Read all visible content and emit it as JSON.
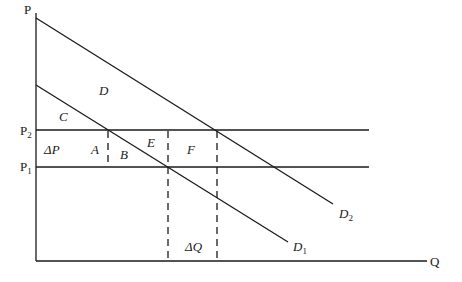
{
  "diagram": {
    "type": "economics-demand-shift",
    "axes": {
      "y_label": "P",
      "x_label": "Q"
    },
    "price_levels": [
      {
        "name": "P2",
        "base": "P",
        "sub": "2"
      },
      {
        "name": "P1",
        "base": "P",
        "sub": "1"
      }
    ],
    "curves": [
      {
        "name": "D2",
        "base": "D",
        "sub": "2"
      },
      {
        "name": "D1",
        "base": "D",
        "sub": "1"
      }
    ],
    "regions": {
      "D": "D",
      "C": "C",
      "A": "A",
      "B": "B",
      "E": "E",
      "F": "F",
      "delta_p": "ΔP",
      "delta_q": "ΔQ"
    },
    "colors": {
      "line": "#1a1a1a",
      "background": "#ffffff"
    }
  }
}
